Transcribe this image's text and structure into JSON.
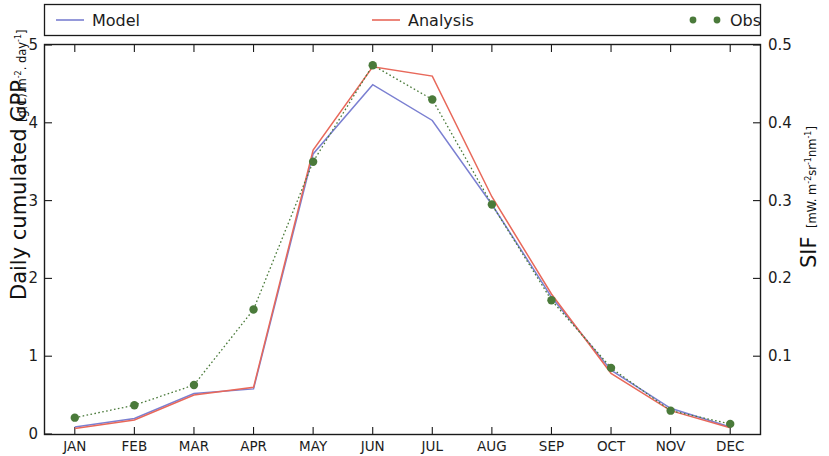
{
  "figure": {
    "background": "#ffffff",
    "width": 829,
    "height": 456
  },
  "legend": {
    "entries": [
      {
        "label": "Model",
        "color": "#7a7fd1",
        "style": "line"
      },
      {
        "label": "Analysis",
        "color": "#e8685a",
        "style": "line"
      },
      {
        "label": "Obs",
        "color": "#4a7a3a",
        "style": "dots"
      }
    ]
  },
  "left_axis": {
    "title": "Daily cumulated GPP",
    "units_prefix": "[g(C).m",
    "units_sup1": "-2",
    "units_mid": ". day",
    "units_sup2": "-1",
    "units_suffix": "]",
    "ticks": [
      "0",
      "1",
      "2",
      "3",
      "4",
      "5"
    ]
  },
  "right_axis": {
    "title": "SIF",
    "units_prefix": "[mW. m",
    "units_sup1": "-2",
    "units_mid": "sr",
    "units_sup2": "-1",
    "units_mid2": "nm",
    "units_sup3": "-1",
    "units_suffix": "]",
    "ticks": [
      "0.1",
      "0.2",
      "0.3",
      "0.4",
      "0.5"
    ]
  },
  "chart_data": {
    "type": "line",
    "title": "",
    "xlabel": "",
    "ylabel": "Daily cumulated GPP [g(C).m-2. day-1]",
    "y2label": "SIF [mW. m-2sr-1nm-1]",
    "categories": [
      "JAN",
      "FEB",
      "MAR",
      "APR",
      "MAY",
      "JUN",
      "JUL",
      "AUG",
      "SEP",
      "OCT",
      "NOV",
      "DEC"
    ],
    "ylim": [
      0,
      5
    ],
    "y2lim": [
      0,
      0.5
    ],
    "yticks": [
      0,
      1,
      2,
      3,
      4,
      5
    ],
    "y2ticks": [
      0.1,
      0.2,
      0.3,
      0.4,
      0.5
    ],
    "grid": false,
    "legend_position": "top",
    "series": [
      {
        "name": "Model",
        "color": "#7a7fd1",
        "axis": "left",
        "style": "solid",
        "values": [
          0.09,
          0.2,
          0.52,
          0.58,
          3.6,
          4.49,
          4.03,
          2.95,
          1.76,
          0.82,
          0.33,
          0.09
        ]
      },
      {
        "name": "Analysis",
        "color": "#e8685a",
        "axis": "left",
        "style": "solid",
        "values": [
          0.07,
          0.18,
          0.5,
          0.6,
          3.65,
          4.72,
          4.6,
          3.05,
          1.8,
          0.78,
          0.3,
          0.08
        ]
      },
      {
        "name": "Obs",
        "color": "#4a7a3a",
        "axis": "right",
        "style": "dotted-markers",
        "values": [
          0.021,
          0.037,
          0.063,
          0.16,
          0.35,
          0.474,
          0.43,
          0.295,
          0.172,
          0.085,
          0.03,
          0.013
        ]
      }
    ]
  }
}
